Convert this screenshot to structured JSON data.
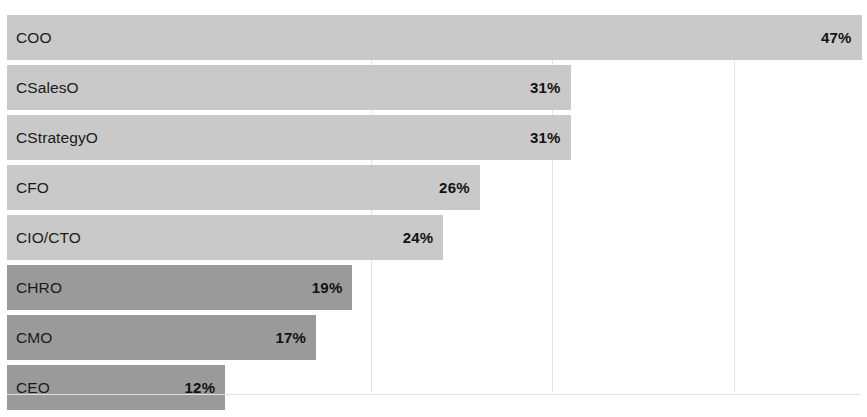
{
  "chart_data": {
    "type": "bar",
    "orientation": "horizontal",
    "title": "",
    "subtitle": "",
    "xlabel": "",
    "ylabel": "",
    "categories": [
      "COO",
      "CSalesO",
      "CStrategyO",
      "CFO",
      "CIO/CTO",
      "CHRO",
      "CMO",
      "CEO"
    ],
    "values": [
      47,
      31,
      31,
      26,
      24,
      19,
      17,
      12
    ],
    "value_labels": [
      "47%",
      "31%",
      "31%",
      "26%",
      "24%",
      "19%",
      "17%",
      "12%"
    ],
    "value_unit": "%",
    "xlim": [
      0,
      47.3
    ],
    "grid": true,
    "gridlines_at": [
      20,
      30,
      40
    ],
    "legend": "none",
    "tick_labels": [],
    "series": [
      {
        "name": "Share of respondents",
        "values": [
          47,
          31,
          31,
          26,
          24,
          19,
          17,
          12
        ]
      }
    ],
    "bars": [
      {
        "category": "COO",
        "value": 47,
        "label": "47%",
        "shade": "light"
      },
      {
        "category": "CSalesO",
        "value": 31,
        "label": "31%",
        "shade": "light"
      },
      {
        "category": "CStrategyO",
        "value": 31,
        "label": "31%",
        "shade": "light"
      },
      {
        "category": "CFO",
        "value": 26,
        "label": "26%",
        "shade": "light"
      },
      {
        "category": "CIO/CTO",
        "value": 24,
        "label": "24%",
        "shade": "light"
      },
      {
        "category": "CHRO",
        "value": 19,
        "label": "19%",
        "shade": "dark"
      },
      {
        "category": "CMO",
        "value": 17,
        "label": "17%",
        "shade": "dark"
      },
      {
        "category": "CEO",
        "value": 12,
        "label": "12%",
        "shade": "dark"
      }
    ]
  },
  "colors": {
    "bar_light": "#c9c9c9",
    "bar_dark": "#9a9a9a",
    "background": "#ffffff",
    "gridline": "#e3e3e3",
    "axis": "#e0e0e0",
    "label_text": "#1a1a1a",
    "value_text": "#121212"
  }
}
